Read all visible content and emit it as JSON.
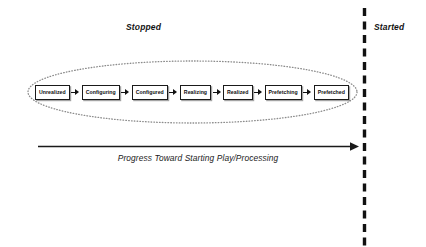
{
  "diagram": {
    "regions": [
      {
        "id": "stopped",
        "label": "Stopped"
      },
      {
        "id": "started",
        "label": "Started"
      }
    ],
    "grouping_shape": {
      "name": "stopped-states-ellipse",
      "style": "dotted",
      "color": "#8c8c8c"
    },
    "divider": {
      "name": "stopped-started-divider",
      "style": "dashed",
      "color": "#111111"
    },
    "states": [
      {
        "label": "Unrealized"
      },
      {
        "label": "Configuring"
      },
      {
        "label": "Configured"
      },
      {
        "label": "Realizing"
      },
      {
        "label": "Realized"
      },
      {
        "label": "Prefetching"
      },
      {
        "label": "Prefetched"
      }
    ],
    "progress_arrow": {
      "caption": "Progress Toward Starting Play/Processing",
      "direction": "left-to-right",
      "color": "#1a1a1a"
    },
    "colors": {
      "background": "#ffffff",
      "box_border": "#1a1a1a",
      "box_fill": "#ffffff",
      "text": "#111111",
      "ellipse": "#8c8c8c",
      "divider": "#111111"
    }
  }
}
